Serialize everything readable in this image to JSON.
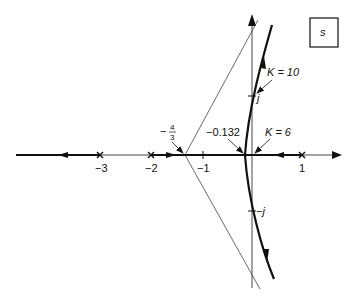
{
  "diagram": {
    "type": "root-locus",
    "plane_label": "s",
    "real_axis": {
      "tick_labels": [
        "-3",
        "-2",
        "-1",
        "1"
      ],
      "tick_values": [
        -3,
        -2,
        -1,
        1
      ]
    },
    "imag_axis": {
      "tick_labels": [
        "j",
        "-j"
      ],
      "tick_values": [
        1,
        -1
      ]
    },
    "poles": [
      -3,
      -2,
      0,
      1
    ],
    "pole_labels": [
      "-3",
      "-2",
      "1"
    ],
    "asymptote_centroid": {
      "label_sign": "−",
      "label_num": "4",
      "label_den": "3",
      "value": -1.3333
    },
    "breakaway": {
      "label": "−0.132",
      "value": -0.132
    },
    "annotations": {
      "k6": "K = 6",
      "k10": "K = 10"
    },
    "axis_labels": {
      "j": "j",
      "neg_j": "−j",
      "m3": "−3",
      "m2": "−2",
      "m1": "−1",
      "p1": "1"
    }
  }
}
